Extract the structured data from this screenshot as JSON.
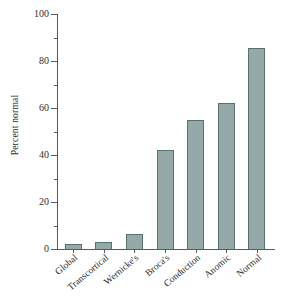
{
  "chart_data": {
    "type": "bar",
    "title": "",
    "xlabel": "",
    "ylabel": "Percent normal",
    "categories": [
      "Global",
      "Transcortical",
      "Wernicke's",
      "Broca's",
      "Conduction",
      "Anomic",
      "Normal"
    ],
    "values": [
      2,
      3,
      6.5,
      42,
      55,
      62,
      85.5
    ],
    "ylim": [
      0,
      100
    ],
    "yticks": [
      0,
      20,
      40,
      60,
      80,
      100
    ],
    "ytick_labels": [
      "0",
      "20",
      "40",
      "60",
      "80",
      "100"
    ],
    "yminor_ticks": [
      10,
      30,
      50,
      70,
      90
    ],
    "grid": false,
    "legend": "none",
    "bar_fill_color": "#95aaa8",
    "bar_edge_color": "#58706f",
    "axis_color": "#5a5a5a",
    "background_color": "#ffffff"
  }
}
